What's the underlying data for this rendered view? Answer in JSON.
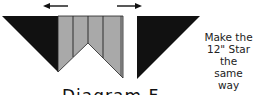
{
  "diagram": {
    "note_lines": [
      "Make the",
      "12\" Star the",
      "same way"
    ],
    "caption": "Diagram F",
    "arrows": [
      {
        "direction": "left",
        "icon": "arrow-left-icon"
      },
      {
        "direction": "right",
        "icon": "arrow-right-icon"
      }
    ],
    "colors": {
      "dark": "#111111",
      "gray": "#a9a9a9",
      "outline": "#222222",
      "background": "#ffffff"
    }
  }
}
